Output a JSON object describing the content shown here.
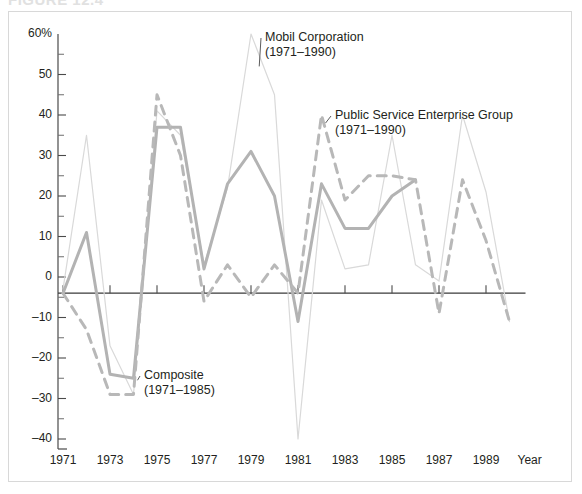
{
  "figure": {
    "caption": "FIGURE 12.4",
    "frame_color": "#d8d8d8"
  },
  "chart_data": {
    "type": "line",
    "title": "",
    "subtitle": "",
    "xlabel": "Year",
    "ylabel": "",
    "ylim": [
      -40,
      60
    ],
    "xlim": [
      1971,
      1990
    ],
    "grid": false,
    "legend_position": "inline-annotations",
    "y_ticks": [
      60,
      50,
      40,
      30,
      20,
      10,
      0,
      -10,
      -20,
      -30,
      -40
    ],
    "y_tick_labels": [
      "60%",
      "50",
      "40",
      "30",
      "20",
      "10",
      "0",
      "–10",
      "–20",
      "–30",
      "–40"
    ],
    "y_minor_ticks": [
      55,
      45,
      35,
      25,
      15,
      5,
      -5,
      -15,
      -25,
      -35
    ],
    "x_ticks": [
      1971,
      1973,
      1975,
      1977,
      1979,
      1981,
      1983,
      1985,
      1987,
      1989
    ],
    "x_tick_labels": [
      "1971",
      "1973",
      "1975",
      "1977",
      "1979",
      "1981",
      "1983",
      "1985",
      "1987",
      "1989"
    ],
    "reference_line": {
      "value": -4,
      "color": "#3a3a3a",
      "label": ""
    },
    "x": [
      1971,
      1972,
      1973,
      1974,
      1975,
      1976,
      1977,
      1978,
      1979,
      1980,
      1981,
      1982,
      1983,
      1984,
      1985,
      1986,
      1987,
      1988,
      1989,
      1990
    ],
    "series": [
      {
        "name": "Mobil Corporation",
        "period": "(1971–1990)",
        "label_line1": "Mobil Corporation",
        "label_line2": "(1971–1990)",
        "color": "#d9d9d9",
        "style": "solid",
        "width": 1.2,
        "values": [
          -3,
          35,
          -17,
          -29,
          41,
          35,
          3,
          22,
          60,
          45,
          -40,
          19,
          2,
          3,
          35,
          3,
          -1,
          40,
          21,
          -11
        ]
      },
      {
        "name": "Composite",
        "period": "(1971–1985)",
        "label_line1": "Composite",
        "label_line2": "(1971–1985)",
        "color": "#b3b3b3",
        "style": "solid",
        "width": 3.0,
        "values": [
          -4,
          11,
          -24,
          -25,
          37,
          37,
          2,
          23,
          31,
          20,
          -11,
          23,
          12,
          12,
          20,
          24,
          null,
          null,
          null,
          null
        ]
      },
      {
        "name": "Public Service Enterprise Group",
        "period": "(1971–1990)",
        "label_line1": "Public Service Enterprise Group",
        "label_line2": "(1971–1990)",
        "color": "#b8b8b8",
        "style": "dashed",
        "width": 3.0,
        "values": [
          -4,
          -13,
          -29,
          -29,
          45,
          30,
          -6,
          3,
          -5,
          3,
          -4,
          40,
          19,
          25,
          25,
          24,
          -9,
          24,
          9,
          -11
        ]
      }
    ],
    "annotations": [
      {
        "name": "mobil-corporation",
        "text_line1": "Mobil Corporation",
        "text_line2": "(1971–1990)",
        "leader_from_x": 1979.2,
        "leader_from_y": 56
      },
      {
        "name": "public-service-enterprise-group",
        "text_line1": "Public Service Enterprise Group",
        "text_line2": "(1971–1990)",
        "leader_from_x": 1982,
        "leader_from_y": 38
      },
      {
        "name": "composite",
        "text_line1": "Composite",
        "text_line2": "(1971–1985)",
        "leader_from_x": 1974,
        "leader_from_y": -26
      }
    ]
  },
  "axis": {
    "year_label": "Year"
  }
}
